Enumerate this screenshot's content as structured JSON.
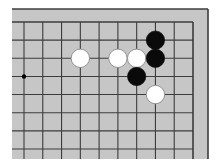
{
  "game": {
    "type": "go",
    "view": "partial board, top-right corner region",
    "columns_visible": 10,
    "rows_visible": 8,
    "closed_edges": [
      "top",
      "right"
    ],
    "colors": {
      "board": "#c6c6c6",
      "grid_line": "#3c3c3c",
      "border": "#3c3c3c",
      "background": "#ffffff",
      "black_stone": "#0a0a0a",
      "white_stone": "#ffffff",
      "white_stone_outline": "#8a8a8a"
    },
    "star_points": [
      {
        "col": 0,
        "row": 3
      }
    ],
    "stones": [
      {
        "color": "white",
        "col": 3,
        "row": 2
      },
      {
        "color": "white",
        "col": 5,
        "row": 2
      },
      {
        "color": "white",
        "col": 6,
        "row": 2
      },
      {
        "color": "white",
        "col": 7,
        "row": 4
      },
      {
        "color": "black",
        "col": 7,
        "row": 1
      },
      {
        "color": "black",
        "col": 7,
        "row": 2
      },
      {
        "color": "black",
        "col": 6,
        "row": 3
      }
    ]
  }
}
